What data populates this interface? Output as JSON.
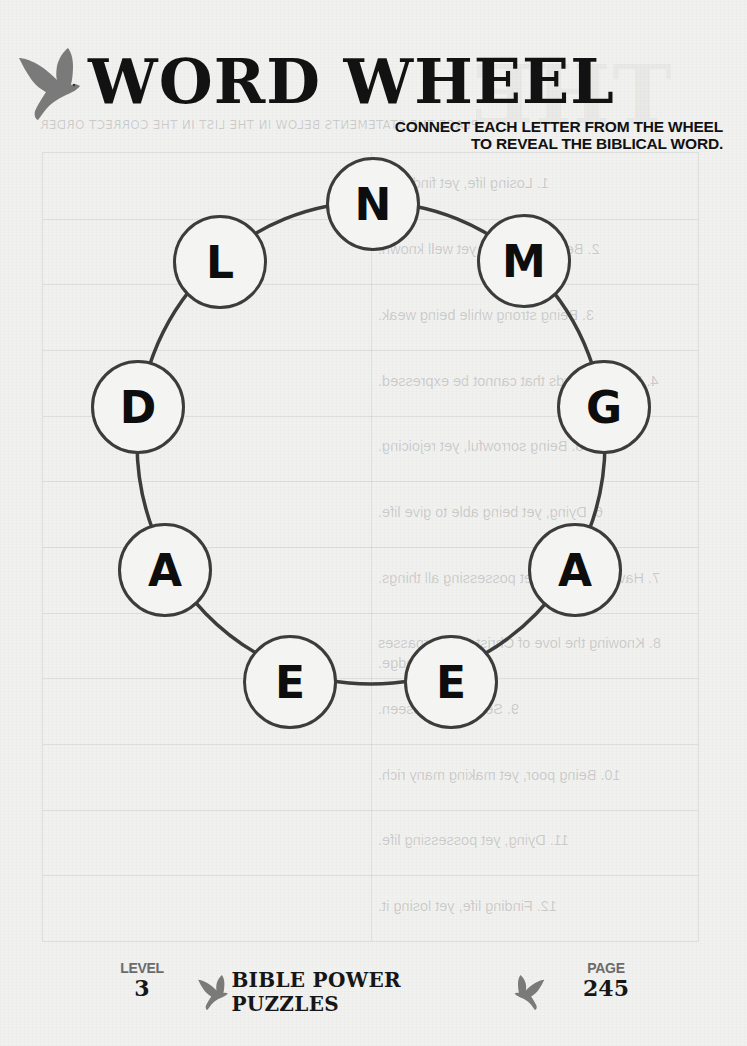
{
  "header": {
    "title": "WORD WHEEL",
    "instructions_line1": "CONNECT EACH LETTER FROM THE WHEEL",
    "instructions_line2": "TO REVEAL THE BIBLICAL WORD.",
    "logo_icon": "dove-icon"
  },
  "wheel": {
    "ring_color": "#3c3c3c",
    "letters": [
      {
        "letter": "N",
        "x": 373,
        "y": 204
      },
      {
        "letter": "M",
        "x": 524,
        "y": 261
      },
      {
        "letter": "G",
        "x": 604,
        "y": 407
      },
      {
        "letter": "A",
        "x": 575,
        "y": 570
      },
      {
        "letter": "E",
        "x": 451,
        "y": 682
      },
      {
        "letter": "E",
        "x": 290,
        "y": 682
      },
      {
        "letter": "A",
        "x": 165,
        "y": 570
      },
      {
        "letter": "D",
        "x": 138,
        "y": 407
      },
      {
        "letter": "L",
        "x": 220,
        "y": 262
      }
    ]
  },
  "bleed_through": {
    "title": "THE",
    "subtitle": "PLACE THE STATEMENTS BELOW IN THE LIST IN THE CORRECT ORDER",
    "rows": [
      "1. Losing life, yet finding it.",
      "2. Being unknown, yet well known.",
      "3. Being strong while being weak.",
      "4. Hearing words that cannot be expressed.",
      "5. Being sorrowful, yet rejoicing.",
      "6. Dying, yet being able to give life.",
      "7. Having nothing, yet possessing all things.",
      "8. Knowing the love of Christ that surpasses knowledge.",
      "9. Seeing the unseen.",
      "10. Being poor, yet making many rich.",
      "11. Dying, yet possessing life.",
      "12. Finding life, yet losing it."
    ]
  },
  "footer": {
    "level_label": "LEVEL",
    "level_value": "3",
    "brand": "BIBLE POWER PUZZLES",
    "page_label": "PAGE",
    "page_value": "245"
  },
  "colors": {
    "paper": "#f1f1f0",
    "ink": "#121212",
    "dove": "#777777",
    "label_grey": "#6b6b6b"
  }
}
